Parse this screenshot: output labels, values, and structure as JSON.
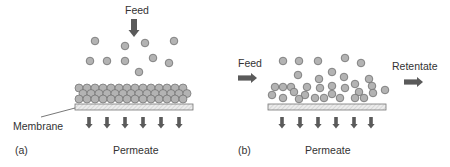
{
  "panel_a": {
    "feed_label": "Feed",
    "membrane_label": "Membrane",
    "permeate_label": "Permeate",
    "panel_label": "(a)"
  },
  "panel_b": {
    "feed_label": "Feed",
    "retentate_label": "Retentate",
    "permeate_label": "Permeate",
    "panel_label": "(b)"
  },
  "colors": {
    "particle_fill": "#b3b3b3",
    "particle_stroke": "#6e6e6e",
    "arrow": "#5a5a5a",
    "membrane_fill": "#e6e6e6",
    "membrane_stroke": "#777777"
  }
}
